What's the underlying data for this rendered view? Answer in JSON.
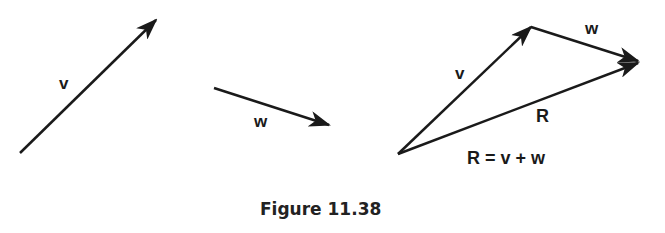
{
  "figure": {
    "caption": "Figure 11.38",
    "left_vector": {
      "label": "v"
    },
    "middle_vector": {
      "label": "w"
    },
    "triangle": {
      "v_label": "v",
      "w_label": "w",
      "r_label": "R",
      "equation": "R = v + w"
    },
    "colors": {
      "stroke": "#1a1a1a",
      "background": "#ffffff"
    }
  }
}
